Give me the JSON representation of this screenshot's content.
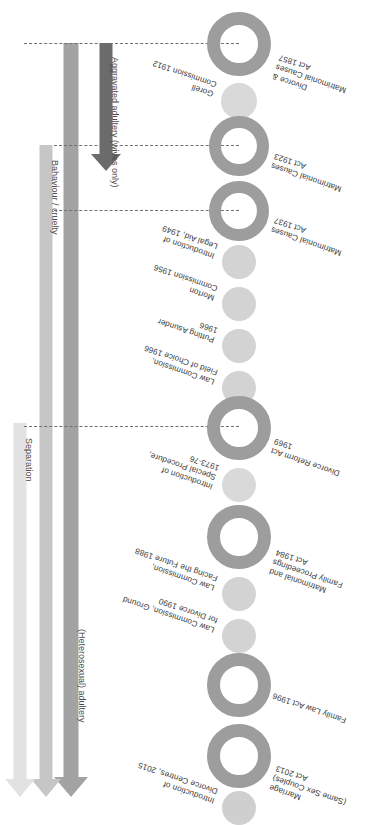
{
  "figure": {
    "orientation": "rotated-180"
  },
  "palette": {
    "ring_dark": "#9d9d9d",
    "ring_mid": "#b4b4b4",
    "dot_light": "#cfcfcf",
    "dot_lighter": "#d9d9d9",
    "arrow_dark": "#6b6b6b",
    "arrow_1": "#a3a3a3",
    "arrow_2": "#c6c6c6",
    "arrow_3": "#e2e2e2",
    "dash": "#6f6f6f",
    "label_text": "#3a3a3a"
  },
  "timeline": {
    "events": [
      {
        "id": "divorce-matrimonial-causes-act-1857",
        "label": "Divorce &\nMatrimonial Causes\nAct 1857",
        "year": "1857",
        "kind": "act",
        "side": "left"
      },
      {
        "id": "gorell-commission-1912",
        "label": "Gorell\nCommission 1912",
        "year": "1912",
        "kind": "report",
        "side": "right"
      },
      {
        "id": "matrimonial-causes-act-1923",
        "label": "Matrimonial Causes\nAct 1923",
        "year": "1923",
        "kind": "act",
        "side": "left"
      },
      {
        "id": "matrimonial-causes-act-1937",
        "label": "Matrimonial Causes\nAct 1937",
        "year": "1937",
        "kind": "act",
        "side": "left"
      },
      {
        "id": "introduction-legal-aid-1949",
        "label": "Introduction of\nLegal Aid, 1949",
        "year": "1949",
        "kind": "report",
        "side": "right"
      },
      {
        "id": "morton-commission-1956",
        "label": "Morton\nCommission 1956",
        "year": "1956",
        "kind": "report",
        "side": "right"
      },
      {
        "id": "putting-asunder-1966",
        "label": "Putting Asunder\n1966",
        "year": "1966",
        "kind": "report",
        "side": "right"
      },
      {
        "id": "law-commission-field-of-choice-1966",
        "label": "Law Commission,\nField of Choice 1966",
        "year": "1966",
        "kind": "report",
        "side": "right"
      },
      {
        "id": "divorce-reform-act-1969",
        "label": "Divorce Reform Act\n1969",
        "year": "1969",
        "kind": "act",
        "side": "left"
      },
      {
        "id": "introduction-special-procedure-1973-76",
        "label": "Introduction of\nSpecial Procedure,\n1973-76",
        "year": "1973-76",
        "kind": "report",
        "side": "right"
      },
      {
        "id": "matrimonial-family-proceedings-act-1984",
        "label": "Matrimonial and\nFamily Proceedings\nAct 1984",
        "year": "1984",
        "kind": "act",
        "side": "left"
      },
      {
        "id": "law-commission-facing-the-future-1988",
        "label": "Law Commission,\nFacing the Future 1988",
        "year": "1988",
        "kind": "report",
        "side": "right"
      },
      {
        "id": "law-commission-ground-for-divorce-1990",
        "label": "Law Commission, Ground\nfor Divorce 1990",
        "year": "1990",
        "kind": "report",
        "side": "right"
      },
      {
        "id": "family-law-act-1996",
        "label": "Family Law Act 1996",
        "year": "1996",
        "kind": "act",
        "side": "left"
      },
      {
        "id": "marriage-same-sex-couples-act-2013",
        "label": "Marriage\n(Same Sex Couples)\nAct 2013",
        "year": "2013",
        "kind": "act",
        "side": "left"
      },
      {
        "id": "introduction-divorce-centres-2015",
        "label": "Introduction of\nDivorce Centres, 2015",
        "year": "2015",
        "kind": "report",
        "side": "right"
      }
    ]
  },
  "grounds": {
    "arrows": [
      {
        "id": "aggravated-adultery",
        "label": "Aggravated adultery (wives only)",
        "color": "#6b6b6b",
        "starts": "1857",
        "ends": "1923"
      },
      {
        "id": "heterosexual-adultery",
        "label": "(Heterosexual) adultery",
        "color": "#a3a3a3",
        "starts": "1857",
        "ends": "present"
      },
      {
        "id": "behaviour-cruelty",
        "label": "Bahaviour / cruelty",
        "color": "#c6c6c6",
        "starts": "1937",
        "ends": "present"
      },
      {
        "id": "separation",
        "label": "Separation",
        "color": "#e2e2e2",
        "starts": "1969",
        "ends": "present"
      }
    ]
  }
}
